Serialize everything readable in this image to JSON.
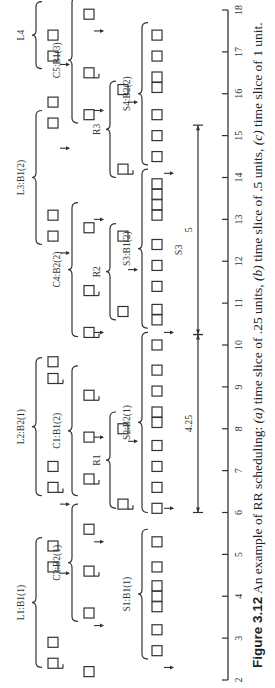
{
  "figure": {
    "caption_number": "Figure 3.12",
    "caption_text": "An example of RR scheduling:",
    "caption_parts": [
      {
        "label": "(a)",
        "text": " time slice of .25 units, "
      },
      {
        "label": "(b)",
        "text": " time slice of .5 units, "
      },
      {
        "label": "(c)",
        "text": " time slice of 1 unit."
      }
    ],
    "orientation": "rotated 90° counter-clockwise"
  },
  "axis": {
    "min": 2,
    "max": 18,
    "ticks": [
      "2",
      "3",
      "4",
      "5",
      "6",
      "7",
      "8",
      "9",
      "10",
      "11",
      "12",
      "13",
      "14",
      "15",
      "16",
      "17",
      "18"
    ]
  },
  "groups": [
    {
      "row": "L",
      "label": "L1:B1(1)",
      "start": 2.3,
      "end": 5.4,
      "boxes": [
        2.4,
        2.9,
        4.7,
        5.2
      ],
      "box_hooks": [
        2.4
      ],
      "arrows": [
        4.55
      ]
    },
    {
      "row": "L",
      "label": "L2:B2(1)",
      "start": 6.4,
      "end": 9.7,
      "boxes": [
        6.6,
        7.1,
        9.2,
        9.6
      ],
      "box_hooks": [
        6.6,
        9.2
      ],
      "arrows": [
        6.2
      ]
    },
    {
      "row": "L",
      "label": "L3:B1(2)",
      "start": 12.4,
      "end": 15.6,
      "boxes": [
        12.6,
        13.1,
        15.3,
        15.8
      ],
      "box_hooks": [],
      "arrows": [
        12.2,
        14.7
      ]
    },
    {
      "row": "L",
      "label": "L4",
      "start": 16.6,
      "end": 18.2,
      "boxes": [
        16.9,
        17.4
      ],
      "box_hooks": [],
      "arrows": [
        16.7
      ]
    },
    {
      "row": "C",
      "label": "C2:B2(1)",
      "start": 3.4,
      "end": 6.2,
      "boxes": [
        3.6,
        4.6,
        5.6
      ],
      "box_hooks": [
        4.6
      ],
      "arrows": [
        3.3,
        5.3
      ]
    },
    {
      "row": "C",
      "label": "C1:B1(2)",
      "start": 6.4,
      "end": 9.5,
      "boxes": [
        6.8,
        7.8,
        8.8
      ],
      "box_hooks": [
        6.8,
        8.8
      ],
      "arrows": [
        7.8
      ]
    },
    {
      "row": "C",
      "label": "C4:B2(2)",
      "start": 10.2,
      "end": 13.4,
      "boxes": [
        10.3,
        11.3,
        12.8
      ],
      "box_hooks": [
        10.3,
        11.3
      ],
      "arrows": [
        10.3,
        13.0
      ]
    },
    {
      "row": "C",
      "label": "C5:B1(3)",
      "start": 15.3,
      "end": 18.3,
      "boxes": [
        15.5,
        16.5,
        17.9
      ],
      "box_hooks": [
        16.5
      ],
      "arrows": [
        15.6,
        17.5
      ]
    },
    {
      "row": "R",
      "label": "R1",
      "start": 6.1,
      "end": 8.4,
      "boxes": [
        6.2,
        8.0
      ],
      "box_hooks": [
        6.2
      ],
      "arrows": [
        7.7
      ]
    },
    {
      "row": "R",
      "label": "R2",
      "start": 10.6,
      "end": 12.9,
      "boxes": [
        10.8,
        12.6
      ],
      "box_hooks": [],
      "arrows": [
        11.8
      ]
    },
    {
      "row": "R",
      "label": "R3",
      "start": 14.0,
      "end": 16.3,
      "boxes": [
        14.2,
        16.1
      ],
      "box_hooks": [
        14.2
      ],
      "arrows": [
        15.8
      ]
    },
    {
      "row": "S",
      "label": "S1:B1(1)",
      "start": 2.5,
      "end": 5.6,
      "boxes": [
        2.7,
        3.2,
        3.75,
        4.0,
        4.25,
        4.7,
        5.3
      ],
      "box_hooks": [],
      "arrows": [
        2.3
      ]
    },
    {
      "row": "S",
      "label": "S2:B2(1)",
      "start": 6.0,
      "end": 10.3,
      "boxes": [
        6.1,
        6.6,
        7.1,
        7.6,
        8.15,
        8.4,
        8.9,
        9.4,
        10.0
      ],
      "box_hooks": [],
      "arrows": [
        6.1,
        10.3
      ]
    },
    {
      "row": "S",
      "label": "S3:B1(2)",
      "start": 10.4,
      "end": 14.2,
      "boxes": [
        10.6,
        10.85,
        11.4,
        11.9,
        12.4,
        13.1,
        13.35,
        13.6,
        13.85
      ],
      "box_hooks": [],
      "arrows": [
        14.1
      ]
    },
    {
      "row": "S",
      "label": "S4:B2(2)",
      "start": 14.3,
      "end": 17.7,
      "boxes": [
        14.5,
        15.0,
        15.5,
        16.15,
        16.4,
        16.9,
        17.4
      ],
      "box_hooks": [],
      "arrows": []
    }
  ],
  "measures": [
    {
      "label": "4.25",
      "from": 6.0,
      "to": 10.25
    },
    {
      "label": "5",
      "from": 10.25,
      "to": 15.25
    }
  ],
  "measure_section_label": "S3",
  "stray_boxes": [
    2.2
  ]
}
